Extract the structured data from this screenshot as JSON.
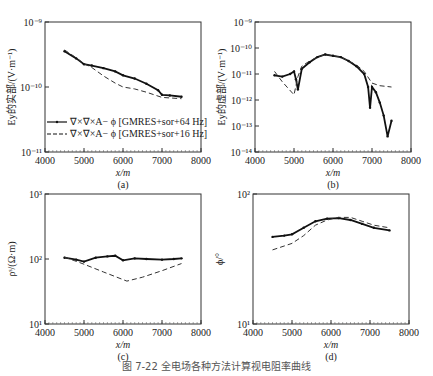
{
  "caption": "图 7-22  全电场各种方法计算视电阻率曲线",
  "chart_data": [
    {
      "id": "a",
      "type": "line",
      "sublabel": "(a)",
      "xlabel": "x/m",
      "ylabel": "Ey的实部/(V·m⁻¹)",
      "xlim": [
        4000,
        8000
      ],
      "xticks": [
        "4000",
        "5000",
        "6000",
        "7000",
        "8000"
      ],
      "yscale": "log",
      "ylim_exp": [
        -11,
        -9
      ],
      "yticks": [
        "10⁻⁹",
        "10⁻¹⁰",
        "10⁻¹¹"
      ],
      "legend": [
        "∇×∇×A− ϕ [GMRES+sor+64 Hz]",
        "∇×∇×A− ϕ [GMRES+sor+16 Hz]"
      ],
      "series": [
        {
          "name": "64 Hz",
          "style": "solid-marker",
          "x": [
            4500,
            4800,
            5000,
            5200,
            5500,
            5800,
            6000,
            6300,
            6600,
            6900,
            7000,
            7200,
            7500
          ],
          "log10y": [
            -9.45,
            -9.56,
            -9.65,
            -9.67,
            -9.71,
            -9.76,
            -9.82,
            -9.87,
            -9.95,
            -10.05,
            -10.12,
            -10.13,
            -10.15
          ]
        },
        {
          "name": "16 Hz",
          "style": "dashed",
          "x": [
            4500,
            4800,
            5000,
            5200,
            5500,
            5800,
            6000,
            6300,
            6600,
            7000,
            7500
          ],
          "log10y": [
            -9.43,
            -9.55,
            -9.64,
            -9.7,
            -9.83,
            -9.94,
            -10.0,
            -10.03,
            -10.08,
            -10.16,
            -10.18
          ]
        }
      ]
    },
    {
      "id": "b",
      "type": "line",
      "sublabel": "(b)",
      "xlabel": "x/m",
      "ylabel": "Ey的虚部/(V·m⁻¹)",
      "xlim": [
        4000,
        8000
      ],
      "xticks": [
        "4000",
        "5000",
        "6000",
        "7000",
        "8000"
      ],
      "yscale": "log",
      "ylim_exp": [
        -14,
        -9
      ],
      "yticks": [
        "10⁻⁹",
        "10⁻¹⁰",
        "10⁻¹¹",
        "10⁻¹²",
        "10⁻¹³",
        "10⁻¹⁴"
      ],
      "series": [
        {
          "name": "64 Hz",
          "style": "solid-marker",
          "x": [
            4500,
            4700,
            4900,
            5000,
            5050,
            5100,
            5200,
            5400,
            5600,
            5800,
            6000,
            6200,
            6400,
            6600,
            6800,
            6900,
            6950,
            7000,
            7100,
            7200,
            7300,
            7400,
            7500
          ],
          "log10y": [
            -11.05,
            -11.1,
            -11.0,
            -10.9,
            -11.2,
            -11.6,
            -10.8,
            -10.55,
            -10.35,
            -10.25,
            -10.3,
            -10.35,
            -10.5,
            -10.7,
            -11.0,
            -11.5,
            -12.3,
            -11.5,
            -11.7,
            -12.1,
            -12.6,
            -13.4,
            -12.8
          ]
        },
        {
          "name": "16 Hz",
          "style": "dashed",
          "x": [
            4500,
            4700,
            5000,
            5100,
            5200,
            5400,
            5600,
            5800,
            6000,
            6200,
            6400,
            6600,
            6800,
            7000,
            7200,
            7500
          ],
          "log10y": [
            -10.9,
            -11.3,
            -11.8,
            -11.1,
            -10.7,
            -10.5,
            -10.35,
            -10.25,
            -10.3,
            -10.35,
            -10.5,
            -10.65,
            -10.9,
            -11.35,
            -11.45,
            -11.5
          ]
        }
      ]
    },
    {
      "id": "c",
      "type": "line",
      "sublabel": "(c)",
      "xlabel": "x/m",
      "ylabel": "ρˢ/(Ω·m)",
      "xlim": [
        4000,
        8000
      ],
      "xticks": [
        "4000",
        "5000",
        "6000",
        "7000",
        "8000"
      ],
      "yscale": "log",
      "ylim_exp": [
        1,
        3
      ],
      "yticks": [
        "10³",
        "10²",
        "10¹"
      ],
      "series": [
        {
          "name": "64 Hz",
          "style": "solid-marker",
          "x": [
            4500,
            4800,
            5000,
            5300,
            5600,
            5800,
            6000,
            6300,
            6600,
            7000,
            7300,
            7500
          ],
          "log10y": [
            2.02,
            1.99,
            1.96,
            2.02,
            2.04,
            2.05,
            1.98,
            2.01,
            2.0,
            1.99,
            2.0,
            2.01
          ]
        },
        {
          "name": "16 Hz",
          "style": "dashed",
          "x": [
            4500,
            5000,
            5500,
            6100,
            6500,
            7000,
            7500
          ],
          "log10y": [
            2.03,
            1.92,
            1.8,
            1.66,
            1.72,
            1.82,
            1.93
          ]
        }
      ]
    },
    {
      "id": "d",
      "type": "line",
      "sublabel": "(d)",
      "xlabel": "x/m",
      "ylabel": "ϕ/°",
      "xlim": [
        4000,
        8000
      ],
      "xticks": [
        "4000",
        "5000",
        "6000",
        "7000",
        "8000"
      ],
      "yscale": "log",
      "ylim_exp": [
        1,
        2
      ],
      "yticks": [
        "10²",
        "10¹"
      ],
      "series": [
        {
          "name": "64 Hz",
          "style": "solid-marker",
          "x": [
            4500,
            4800,
            5000,
            5300,
            5600,
            5900,
            6200,
            6500,
            6800,
            7100,
            7500
          ],
          "log10y": [
            1.67,
            1.68,
            1.69,
            1.74,
            1.79,
            1.81,
            1.815,
            1.8,
            1.77,
            1.74,
            1.72
          ]
        },
        {
          "name": "16 Hz",
          "style": "dashed",
          "x": [
            4500,
            4800,
            5000,
            5300,
            5600,
            5900,
            6200,
            6500,
            6800,
            7100,
            7500
          ],
          "log10y": [
            1.57,
            1.6,
            1.62,
            1.68,
            1.76,
            1.8,
            1.82,
            1.82,
            1.79,
            1.76,
            1.74
          ]
        }
      ]
    }
  ]
}
